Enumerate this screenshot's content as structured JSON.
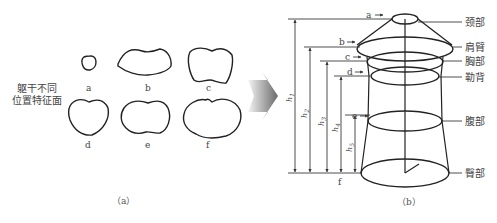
{
  "panel_a": {
    "side_label_line1": "躯干不同",
    "side_label_line2": "位置特征面",
    "shapes": [
      {
        "label": "a"
      },
      {
        "label": "b"
      },
      {
        "label": "c"
      },
      {
        "label": "d"
      },
      {
        "label": "e"
      },
      {
        "label": "f"
      }
    ],
    "caption": "（a）"
  },
  "arrow": {
    "icon": "right-arrow-icon"
  },
  "panel_b": {
    "level_markers": [
      "a",
      "b",
      "c",
      "d",
      "e",
      "f"
    ],
    "heights": [
      "h1",
      "h2",
      "h3",
      "h4",
      "h5"
    ],
    "height_labels": [
      {
        "base": "h",
        "sub": "1"
      },
      {
        "base": "h",
        "sub": "2"
      },
      {
        "base": "h",
        "sub": "3"
      },
      {
        "base": "h",
        "sub": "4"
      },
      {
        "base": "h",
        "sub": "5"
      }
    ],
    "body_parts": [
      "颈部",
      "肩臂",
      "胸部",
      "勒背",
      "腹部",
      "臀部"
    ],
    "caption": "（b）"
  }
}
